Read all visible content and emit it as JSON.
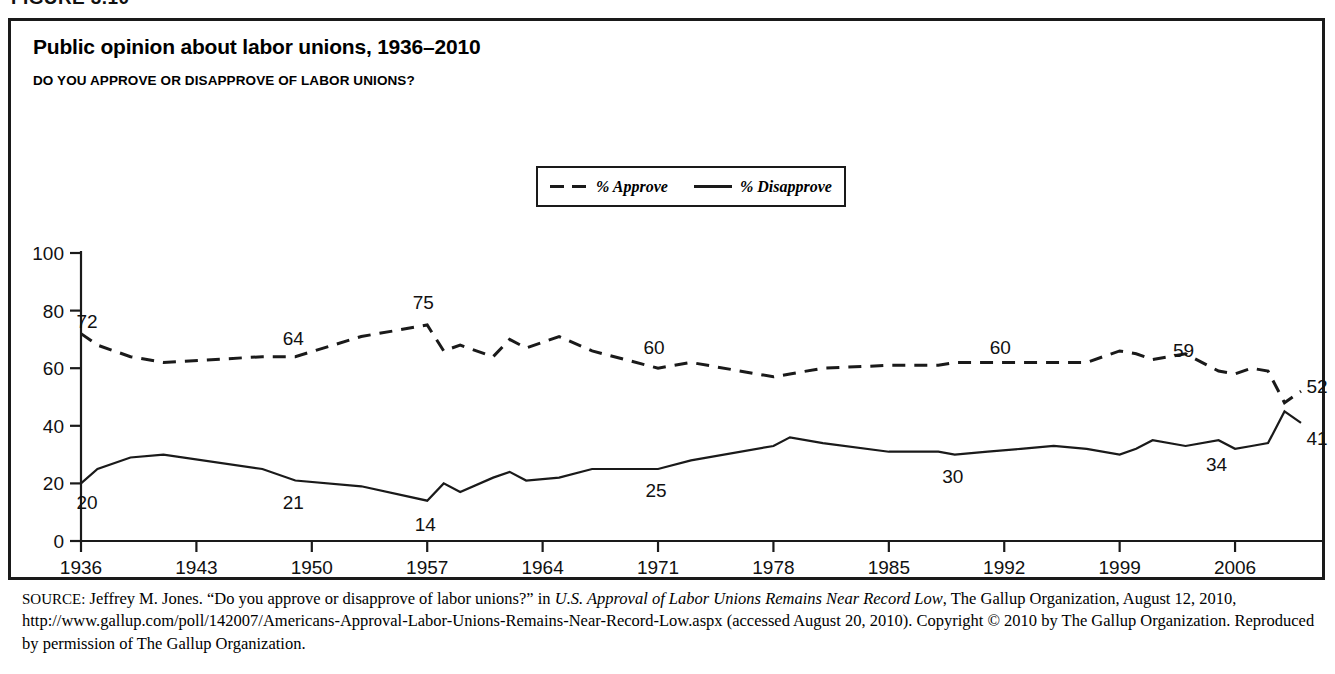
{
  "figure": {
    "label": "FIGURE 3.10"
  },
  "chart": {
    "title": "Public opinion about labor unions, 1936–2010",
    "subtitle": "DO YOU APPROVE OR DISAPPROVE OF LABOR UNIONS?"
  },
  "legend": {
    "items": [
      {
        "label": "% Approve",
        "style": "dashed"
      },
      {
        "label": "% Disapprove",
        "style": "solid"
      }
    ]
  },
  "source": {
    "tag": "SOURCE:",
    "text_1": " Jeffrey M. Jones. “Do you approve or disapprove of labor unions?” in ",
    "italic_title": "U.S. Approval of Labor Unions Remains Near Record Low",
    "text_2": ", The Gallup Organization, August 12, 2010, http://www.gallup.com/poll/142007/Americans-Approval-Labor-Unions-Remains-Near-Record-Low.aspx (accessed August 20, 2010). Copyright © 2010 by The Gallup Organization. Reproduced by permission of The Gallup Organization."
  },
  "chart_data": {
    "type": "line",
    "title": "Public opinion about labor unions, 1936–2010",
    "subtitle": "DO YOU APPROVE OR DISAPPROVE OF LABOR UNIONS?",
    "xlabel": "",
    "ylabel": "",
    "xlim": [
      1936,
      2010
    ],
    "ylim": [
      0,
      100
    ],
    "yticks": [
      0,
      20,
      40,
      60,
      80,
      100
    ],
    "xticks": [
      1936,
      1943,
      1950,
      1957,
      1964,
      1971,
      1978,
      1985,
      1992,
      1999,
      2006
    ],
    "grid": false,
    "legend_position": "top-center",
    "annotations": [
      {
        "series": "% Approve",
        "x": 1936,
        "y": 72,
        "text": "72"
      },
      {
        "series": "% Approve",
        "x": 1949,
        "y": 64,
        "text": "64"
      },
      {
        "series": "% Approve",
        "x": 1957,
        "y": 75,
        "text": "75"
      },
      {
        "series": "% Approve",
        "x": 1971,
        "y": 60,
        "text": "60"
      },
      {
        "series": "% Approve",
        "x": 1992,
        "y": 60,
        "text": "60"
      },
      {
        "series": "% Approve",
        "x": 2003,
        "y": 59,
        "text": "59"
      },
      {
        "series": "% Approve",
        "x": 2010,
        "y": 52,
        "text": "52"
      },
      {
        "series": "% Disapprove",
        "x": 1936,
        "y": 20,
        "text": "20"
      },
      {
        "series": "% Disapprove",
        "x": 1949,
        "y": 21,
        "text": "21"
      },
      {
        "series": "% Disapprove",
        "x": 1957,
        "y": 14,
        "text": "14"
      },
      {
        "series": "% Disapprove",
        "x": 1971,
        "y": 25,
        "text": "25"
      },
      {
        "series": "% Disapprove",
        "x": 1989,
        "y": 30,
        "text": "30"
      },
      {
        "series": "% Disapprove",
        "x": 2005,
        "y": 34,
        "text": "34"
      },
      {
        "series": "% Disapprove",
        "x": 2010,
        "y": 41,
        "text": "41"
      }
    ],
    "x": [
      1936,
      1937,
      1939,
      1941,
      1947,
      1949,
      1953,
      1957,
      1958,
      1959,
      1961,
      1962,
      1963,
      1965,
      1967,
      1971,
      1973,
      1978,
      1979,
      1981,
      1985,
      1988,
      1989,
      1991,
      1993,
      1995,
      1997,
      1999,
      2000,
      2001,
      2003,
      2005,
      2006,
      2007,
      2008,
      2009,
      2010
    ],
    "series": [
      {
        "name": "% Approve",
        "style": "dashed",
        "values": [
          72,
          68,
          64,
          62,
          64,
          64,
          71,
          75,
          66,
          68,
          64,
          70,
          67,
          71,
          66,
          60,
          62,
          57,
          58,
          60,
          61,
          61,
          62,
          62,
          62,
          62,
          62,
          66,
          65,
          63,
          65,
          59,
          58,
          60,
          59,
          48,
          52
        ]
      },
      {
        "name": "% Disapprove",
        "style": "solid",
        "values": [
          20,
          25,
          29,
          30,
          25,
          21,
          19,
          14,
          20,
          17,
          22,
          24,
          21,
          22,
          25,
          25,
          28,
          33,
          36,
          34,
          31,
          31,
          30,
          31,
          32,
          33,
          32,
          30,
          32,
          35,
          33,
          35,
          32,
          33,
          34,
          45,
          41
        ]
      }
    ]
  }
}
